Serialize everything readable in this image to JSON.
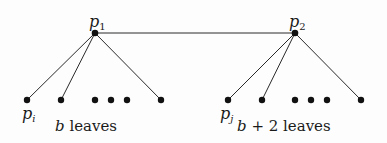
{
  "diagram": {
    "nodes": {
      "p1": {
        "label": "p",
        "sub": "1",
        "x": 95,
        "y": 33
      },
      "p2": {
        "label": "p",
        "sub": "2",
        "x": 295,
        "y": 33
      }
    },
    "left_group": {
      "parent": "p1",
      "leaf_label": "p",
      "leaf_sub": "i",
      "caption_var": "b",
      "caption_text": " leaves"
    },
    "right_group": {
      "parent": "p2",
      "leaf_label": "p",
      "leaf_sub": "j",
      "caption_var": "b",
      "caption_text": " + 2 leaves"
    },
    "ellipsis": "• • •"
  }
}
